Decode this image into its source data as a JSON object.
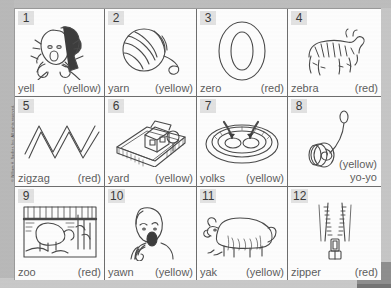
{
  "worksheet": {
    "copyright": "© William H. Sadlier, Inc.  All rights reserved.",
    "columns": 4,
    "rows": 3,
    "items": [
      {
        "number": "1",
        "word": "yell",
        "color": "(yellow)",
        "icon": "girl-yelling-icon",
        "layout": "inline"
      },
      {
        "number": "2",
        "word": "yarn",
        "color": "(yellow)",
        "icon": "yarn-ball-icon",
        "layout": "inline"
      },
      {
        "number": "3",
        "word": "zero",
        "color": "(red)",
        "icon": "zero-digit-icon",
        "layout": "inline"
      },
      {
        "number": "4",
        "word": "zebra",
        "color": "(red)",
        "icon": "zebra-icon",
        "layout": "inline"
      },
      {
        "number": "5",
        "word": "zigzag",
        "color": "(red)",
        "icon": "zigzag-line-icon",
        "layout": "inline"
      },
      {
        "number": "6",
        "word": "yard",
        "color": "(yellow)",
        "icon": "house-yard-icon",
        "layout": "inline"
      },
      {
        "number": "7",
        "word": "yolks",
        "color": "(yellow)",
        "icon": "egg-yolks-icon",
        "layout": "inline"
      },
      {
        "number": "8",
        "word": "yo-yo",
        "color": "(yellow)",
        "icon": "yoyo-icon",
        "layout": "stacked"
      },
      {
        "number": "9",
        "word": "zoo",
        "color": "(red)",
        "icon": "zoo-scene-icon",
        "layout": "inline"
      },
      {
        "number": "10",
        "word": "yawn",
        "color": "(yellow)",
        "icon": "boy-yawning-icon",
        "layout": "inline"
      },
      {
        "number": "11",
        "word": "yak",
        "color": "(yellow)",
        "icon": "yak-icon",
        "layout": "inline"
      },
      {
        "number": "12",
        "word": "zipper",
        "color": "(red)",
        "icon": "zipper-icon",
        "layout": "inline"
      }
    ]
  },
  "colors": {
    "page_background": "#c6c6c6",
    "sheet_background": "#fdfdfd",
    "grid_line": "#6e6e6e",
    "number_badge_background": "#e2e2e2",
    "text": "#5e5e5e",
    "corner_block": "#8e8e8e"
  }
}
